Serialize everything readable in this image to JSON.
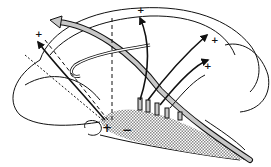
{
  "diagram": {
    "type": "anatomical-line-drawing",
    "colors": {
      "stroke": "#111111",
      "tract_fill": "#c8c8c8",
      "stipple": "#9a9a9a",
      "background": "#ffffff"
    },
    "labels": [
      {
        "id": "plus-top-left",
        "text": "+"
      },
      {
        "id": "plus-top-center",
        "text": "+"
      },
      {
        "id": "plus-right-upper",
        "text": "+"
      },
      {
        "id": "plus-right-lower",
        "text": "+"
      },
      {
        "id": "plus-origin",
        "text": "+"
      },
      {
        "id": "minus-origin",
        "text": "−"
      }
    ]
  }
}
